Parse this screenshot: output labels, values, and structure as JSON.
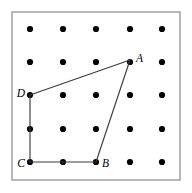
{
  "figure": {
    "background_color": "#ffffff",
    "frame": {
      "x": 12,
      "y": 12,
      "width": 168,
      "height": 168,
      "stroke_color": "#9a9a9a",
      "stroke_width": 1.4
    },
    "grid": {
      "rows": 5,
      "columns": 5,
      "x_positions": [
        30,
        63,
        96,
        130,
        162
      ],
      "y_positions": [
        29,
        62,
        95,
        129,
        162
      ],
      "dot_radius": 3.1,
      "dot_color": "#000000"
    },
    "shape": {
      "name": "ABCD",
      "stroke_color": "#3a3a3a",
      "stroke_width": 1.15,
      "closed": true,
      "vertices": [
        {
          "label": "A",
          "x": 130,
          "y": 60,
          "grid_col": 4,
          "grid_row": 2,
          "label_x": 136,
          "label_y": 59,
          "label_anchor": "right"
        },
        {
          "label": "B",
          "x": 96,
          "y": 162,
          "grid_col": 3,
          "grid_row": 5,
          "label_x": 102,
          "label_y": 164,
          "label_anchor": "right"
        },
        {
          "label": "C",
          "x": 30,
          "y": 162,
          "grid_col": 1,
          "grid_row": 5,
          "label_x": 25,
          "label_y": 164,
          "label_anchor": "left"
        },
        {
          "label": "D",
          "x": 30,
          "y": 95,
          "grid_col": 1,
          "grid_row": 3,
          "label_x": 25,
          "label_y": 94,
          "label_anchor": "left"
        }
      ],
      "edges": [
        {
          "name": "edge-AB",
          "from": "A",
          "to": "B"
        },
        {
          "name": "edge-BC",
          "from": "B",
          "to": "C"
        },
        {
          "name": "edge-CD",
          "from": "C",
          "to": "D"
        },
        {
          "name": "edge-DA",
          "from": "D",
          "to": "A"
        }
      ]
    }
  }
}
